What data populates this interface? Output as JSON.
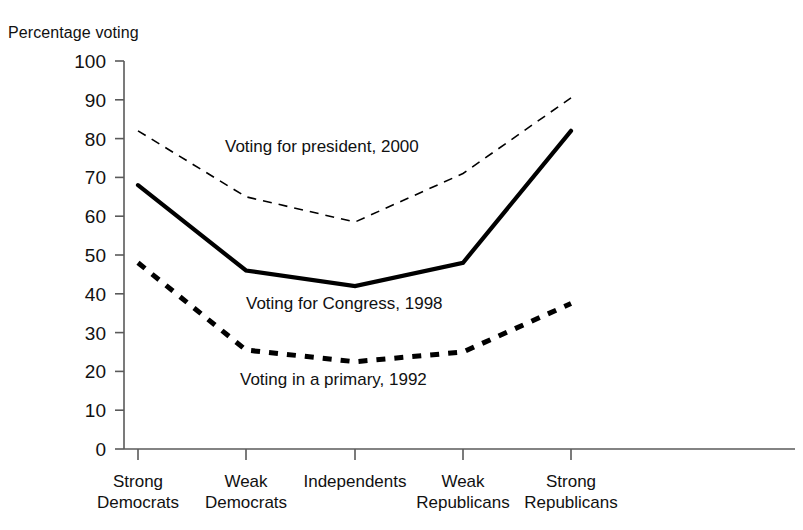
{
  "chart_data": {
    "type": "line",
    "title": "",
    "xlabel": "",
    "ylabel": "Percentage voting",
    "ylim": [
      0,
      100
    ],
    "ytick_step": 10,
    "yticks": [
      0,
      10,
      20,
      30,
      40,
      50,
      60,
      70,
      80,
      90,
      100
    ],
    "grid": false,
    "legend_position": "inline-annotations",
    "categories": [
      "Strong Democrats",
      "Weak Democrats",
      "Independents",
      "Weak Republicans",
      "Strong Republicans"
    ],
    "category_lines": [
      [
        "Strong",
        "Democrats"
      ],
      [
        "Weak",
        "Democrats"
      ],
      [
        "Independents",
        ""
      ],
      [
        "Weak",
        "Republicans"
      ],
      [
        "Strong",
        "Republicans"
      ]
    ],
    "series": [
      {
        "name": "Voting for president, 2000",
        "style": "fine-dashed",
        "color": "#000000",
        "values": [
          82,
          65,
          58.5,
          71,
          90.5
        ]
      },
      {
        "name": "Voting for Congress, 1998",
        "style": "solid",
        "color": "#000000",
        "values": [
          68,
          46,
          42,
          48,
          82
        ]
      },
      {
        "name": "Voting in a primary, 1992",
        "style": "bold-dashed",
        "color": "#000000",
        "values": [
          48,
          25.5,
          22.5,
          25,
          37.5
        ]
      }
    ],
    "annotations": [
      {
        "text": "Voting for president, 2000",
        "x": 225,
        "y": 152
      },
      {
        "text": "Voting for Congress, 1998",
        "x": 246,
        "y": 309
      },
      {
        "text": "Voting in a primary, 1992",
        "x": 240,
        "y": 385
      }
    ]
  }
}
